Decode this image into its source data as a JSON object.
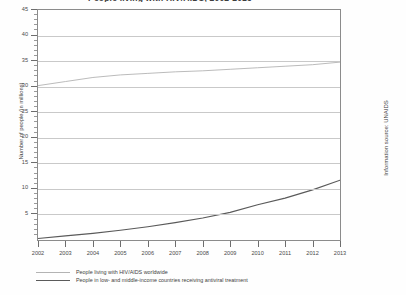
{
  "chart_title": "People living with HIV/AIDS, 2002-2013",
  "axes": {
    "y_title": "Number of people (in millions)",
    "y_ticks": [
      "5",
      "10",
      "15",
      "20",
      "25",
      "30",
      "35",
      "40",
      "45"
    ],
    "x_ticks": [
      "2002",
      "2003",
      "2004",
      "2005",
      "2006",
      "2007",
      "2008",
      "2009",
      "2010",
      "2011",
      "2012",
      "2013"
    ]
  },
  "source_note": "Information source: UNAIDS",
  "legend": {
    "items": [
      {
        "label": "People living with HIV/AIDS worldwide",
        "color": "#b3b3b3"
      },
      {
        "label": "People in low- and middle-income countries receiving antiviral treatment",
        "color": "#5a5a5a"
      }
    ]
  },
  "chart_data": {
    "type": "line",
    "title": "People living with HIV/AIDS, 2002-2013",
    "xlabel": "",
    "ylabel": "Number of people (in millions)",
    "x": [
      2002,
      2003,
      2004,
      2005,
      2006,
      2007,
      2008,
      2009,
      2010,
      2011,
      2012,
      2013
    ],
    "xlim": [
      2002,
      2013
    ],
    "ylim": [
      0,
      45
    ],
    "y_tick_step": 5,
    "grid": true,
    "legend_position": "bottom-left",
    "series": [
      {
        "name": "People living with HIV/AIDS worldwide",
        "color": "#b3b3b3",
        "values": [
          30.2,
          31.0,
          31.8,
          32.3,
          32.6,
          32.9,
          33.1,
          33.4,
          33.7,
          34.0,
          34.3,
          34.8
        ]
      },
      {
        "name": "People in low- and middle-income countries receiving antiviral treatment",
        "color": "#5a5a5a",
        "values": [
          0.3,
          0.8,
          1.3,
          1.9,
          2.6,
          3.4,
          4.3,
          5.4,
          6.9,
          8.2,
          9.8,
          11.7
        ]
      }
    ]
  }
}
